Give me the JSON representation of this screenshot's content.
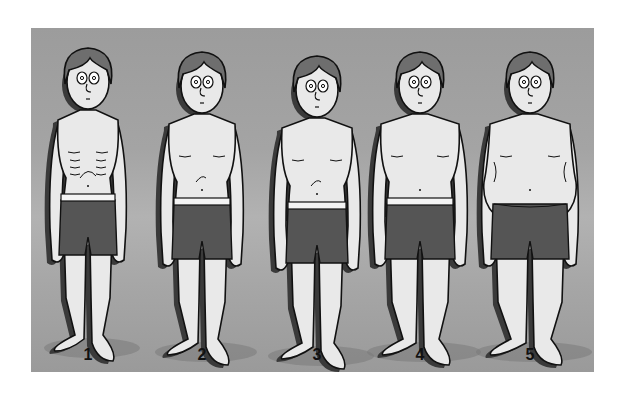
{
  "illustration": {
    "description": "Five cartoon male figures in boxer shorts showing increasing body size",
    "colors": {
      "background": "#a8a8a8",
      "skin": "#e9e9e9",
      "hair": "#6e6e6e",
      "shorts": "#555555",
      "waistband": "#f4f4f4",
      "outline": "#111111",
      "shadow": "#3a3a3a"
    },
    "figures": [
      {
        "label": "1",
        "cx": 57,
        "shoulder": 30,
        "waist": 22,
        "hip": 26,
        "leg": 11,
        "head_y": 20,
        "waistband": true,
        "ribs": true,
        "belly": false
      },
      {
        "label": "2",
        "cx": 171,
        "shoulder": 33,
        "waist": 25,
        "hip": 27,
        "leg": 12,
        "head_y": 24,
        "waistband": true,
        "ribs": false,
        "belly": false
      },
      {
        "label": "3",
        "cx": 286,
        "shoulder": 35,
        "waist": 27,
        "hip": 28,
        "leg": 13,
        "head_y": 28,
        "waistband": true,
        "ribs": false,
        "belly": false
      },
      {
        "label": "4",
        "cx": 389,
        "shoulder": 39,
        "waist": 31,
        "hip": 32,
        "leg": 15,
        "head_y": 24,
        "waistband": true,
        "ribs": false,
        "belly": false
      },
      {
        "label": "5",
        "cx": 499,
        "shoulder": 40,
        "waist": 38,
        "hip": 36,
        "leg": 17,
        "head_y": 24,
        "waistband": false,
        "ribs": false,
        "belly": true
      }
    ]
  }
}
